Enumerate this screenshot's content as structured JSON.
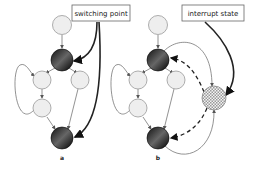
{
  "diagram": {
    "panel_a": {
      "caption": "a",
      "callout": "switching point"
    },
    "panel_b": {
      "caption": "b",
      "callout": "interrupt state"
    }
  },
  "colors": {
    "light_node_fill": "#eeeeee",
    "node_stroke": "#888888",
    "dark_node": "#1a1a1a",
    "edge": "#777777",
    "callout_arrow": "#222222",
    "hatched_node": "#cccccc"
  }
}
